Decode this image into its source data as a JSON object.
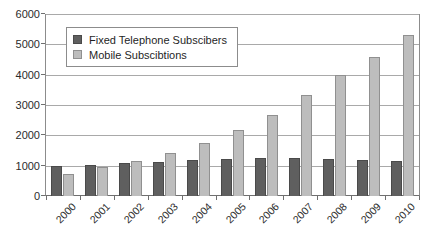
{
  "chart_data": {
    "type": "bar",
    "title": "",
    "xlabel": "",
    "ylabel": "",
    "categories": [
      "2000",
      "2001",
      "2002",
      "2003",
      "2004",
      "2005",
      "2006",
      "2007",
      "2008",
      "2009",
      "2010"
    ],
    "series": [
      {
        "name": "Fixed Telephone Subscibers",
        "color": "#5f5f5f",
        "values": [
          980,
          1020,
          1090,
          1130,
          1200,
          1240,
          1250,
          1245,
          1240,
          1180,
          1175
        ]
      },
      {
        "name": "Mobile Subscibtions",
        "color": "#bdbdbd",
        "values": [
          740,
          960,
          1160,
          1420,
          1760,
          2200,
          2700,
          3350,
          4000,
          4600,
          5350
        ]
      }
    ],
    "ylim": [
      0,
      6000
    ],
    "yticks": [
      0,
      1000,
      2000,
      3000,
      4000,
      5000,
      6000
    ],
    "ytick_labels": [
      "0",
      "1000",
      "2000",
      "3000",
      "4000",
      "5000",
      "6000"
    ],
    "grid": true,
    "legend_position": "upper-left-inside"
  },
  "legend": {
    "items": [
      {
        "label": "Fixed Telephone Subscibers",
        "swatch": "legend-swatch-fixed"
      },
      {
        "label": "Mobile Subscibtions",
        "swatch": "legend-swatch-mobile"
      }
    ]
  }
}
